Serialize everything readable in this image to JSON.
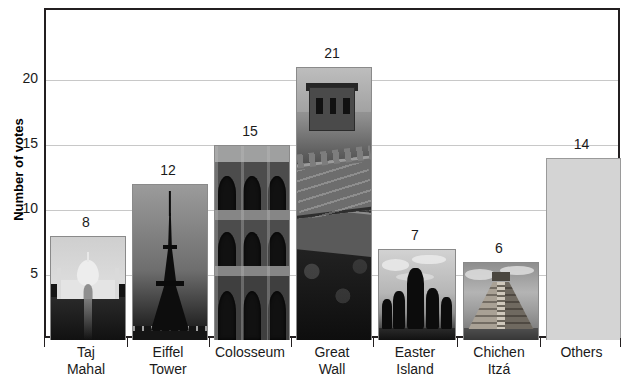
{
  "chart_data": {
    "type": "bar",
    "title": "",
    "xlabel": "",
    "ylabel": "Number of votes",
    "ylim": [
      0,
      25
    ],
    "y_ticks": [
      5,
      10,
      15,
      20
    ],
    "grid": true,
    "legend": "none",
    "categories": [
      "Taj Mahal",
      "Eiffel Tower",
      "Colosseum",
      "Great Wall",
      "Easter Island",
      "Chichen Itzá",
      "Others"
    ],
    "category_lines": [
      [
        "Taj",
        "Mahal"
      ],
      [
        "Eiffel",
        "Tower"
      ],
      [
        "Colosseum",
        ""
      ],
      [
        "Great",
        "Wall"
      ],
      [
        "Easter",
        "Island"
      ],
      [
        "Chichen",
        "Itzá"
      ],
      [
        "Others",
        ""
      ]
    ],
    "values": [
      8,
      12,
      15,
      21,
      7,
      6,
      14
    ],
    "value_labels": [
      "8",
      "12",
      "15",
      "21",
      "7",
      "6",
      "14"
    ],
    "bar_fills": [
      "photo-taj-mahal",
      "photo-eiffel-tower",
      "photo-colosseum",
      "photo-great-wall",
      "photo-easter-island",
      "photo-chichen-itza",
      "solid-light-gray"
    ],
    "colors": {
      "axis": "#231f20",
      "gridline": "#c8c8c8",
      "plain_bar_fill": "#d4d4d4",
      "plain_bar_border": "#9a9a9a",
      "label_text": "#1a1a1a",
      "background": "#ffffff"
    }
  }
}
